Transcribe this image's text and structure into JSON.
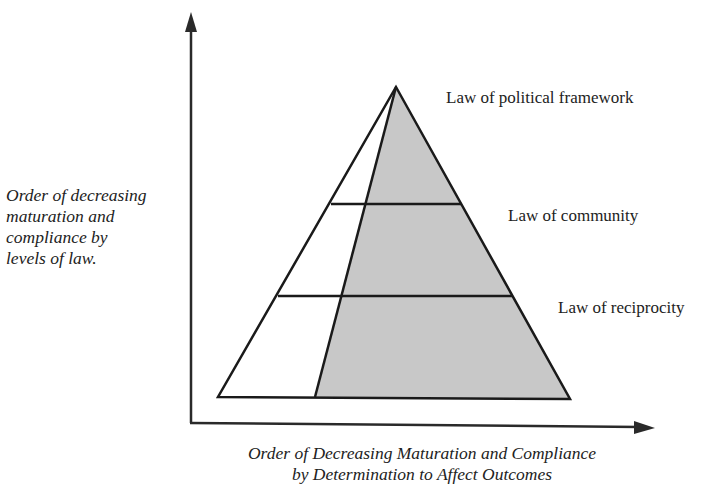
{
  "diagram": {
    "type": "pyramid",
    "y_axis": {
      "label_lines": [
        "Order of decreasing",
        "maturation and",
        "compliance by",
        "levels of law."
      ]
    },
    "x_axis": {
      "label_lines": [
        "Order of Decreasing Maturation and Compliance",
        "by Determination to Affect Outcomes"
      ]
    },
    "levels": [
      {
        "label": "Law of political framework",
        "position": "top"
      },
      {
        "label": "Law of community",
        "position": "middle"
      },
      {
        "label": "Law of reciprocity",
        "position": "bottom"
      }
    ],
    "colors": {
      "line": "#1a1a1a",
      "shaded_fill": "#c8c8c8",
      "unshaded_fill": "#ffffff",
      "background": "#ffffff"
    }
  }
}
